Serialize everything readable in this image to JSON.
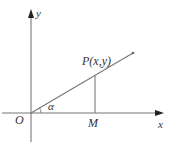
{
  "diagram": {
    "type": "coordinate-plane",
    "axes": {
      "x_label": "x",
      "y_label": "y",
      "origin_label": "O"
    },
    "point_p": {
      "name": "P",
      "coords_text": "(x,y)",
      "label": "P(x,y)"
    },
    "point_m": {
      "label": "M"
    },
    "angle": {
      "label": "α"
    },
    "colors": {
      "stroke": "#777777",
      "text": "#333333",
      "background": "#ffffff"
    }
  }
}
